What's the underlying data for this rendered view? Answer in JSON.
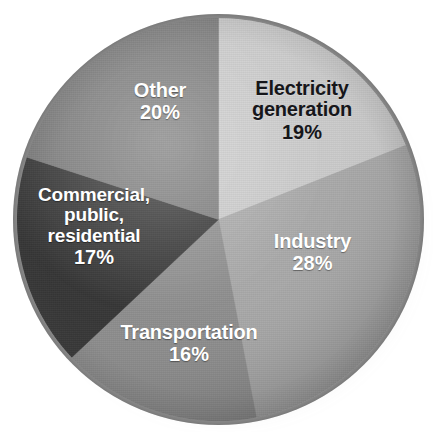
{
  "chart_data": {
    "type": "pie",
    "title": "",
    "xlabel": "",
    "ylabel": "",
    "units": "percent",
    "start_angle_deg": 0,
    "direction": "clockwise",
    "legend": "none",
    "labels_placement": "inside-slices",
    "categories": [
      "Electricity generation",
      "Industry",
      "Transportation",
      "Commercial, public, residential",
      "Other"
    ],
    "values": [
      19,
      28,
      16,
      17,
      20
    ],
    "value_labels": [
      "19%",
      "28%",
      "16%",
      "17%",
      "20%"
    ],
    "colors": [
      "#c9c9c9",
      "#a6a6a6",
      "#8a8a8a",
      "#2e2e2e",
      "#777777"
    ],
    "slices": [
      {
        "name": "Electricity generation",
        "label_line1": "Electricity",
        "label_line2": "generation",
        "value": 19,
        "value_label": "19%",
        "color": "#c9c9c9",
        "text_color": "#16161a",
        "start_deg": 0,
        "end_deg": 68.4
      },
      {
        "name": "Industry",
        "label_line1": "Industry",
        "label_line2": "",
        "value": 28,
        "value_label": "28%",
        "color": "#a6a6a6",
        "text_color": "#ffffff",
        "start_deg": 68.4,
        "end_deg": 169.2
      },
      {
        "name": "Transportation",
        "label_line1": "Transportation",
        "label_line2": "",
        "value": 16,
        "value_label": "16%",
        "color": "#8a8a8a",
        "text_color": "#ffffff",
        "start_deg": 169.2,
        "end_deg": 226.8
      },
      {
        "name": "Commercial, public, residential",
        "label_line1": "Commercial,",
        "label_line2": "public,",
        "label_line3": "residential",
        "value": 17,
        "value_label": "17%",
        "color": "#2e2e2e",
        "text_color": "#ffffff",
        "start_deg": 226.8,
        "end_deg": 288.0
      },
      {
        "name": "Other",
        "label_line1": "Other",
        "label_line2": "",
        "value": 20,
        "value_label": "20%",
        "color": "#777777",
        "text_color": "#ffffff",
        "start_deg": 288.0,
        "end_deg": 360.0
      }
    ],
    "total": 100
  },
  "page": {
    "background_color": "#ffffff",
    "rim_color": "#9a9a9a",
    "title_remnant": ""
  }
}
